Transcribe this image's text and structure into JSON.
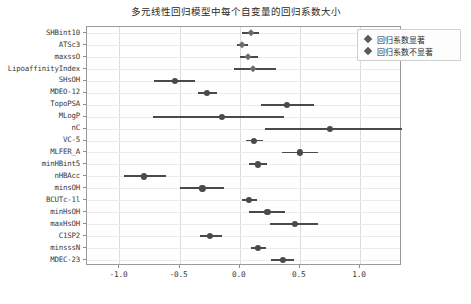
{
  "chart_data": {
    "type": "scatter",
    "title": "多元线性回归模型中每个自变量的回归系数大小",
    "xlabel": "",
    "ylabel": "",
    "xlim": [
      -1.27,
      1.35
    ],
    "ylim": [
      0,
      21
    ],
    "grid": true,
    "xticks": [
      -1.0,
      -0.5,
      0.0,
      0.5,
      1.0
    ],
    "xticklabels": [
      "-1.0",
      "-0.5",
      "0.0",
      "0.5",
      "1.0"
    ],
    "legend_position": "upper right",
    "legend": [
      {
        "label": "回归系数显著",
        "marker": "diamond",
        "color": "#5a5a5a"
      },
      {
        "label": "回归系数不显著",
        "marker": "diamond",
        "color": "#6b6b6b"
      }
    ],
    "categories": [
      "SHBint10",
      "ATSc3",
      "maxssO",
      "LipoaffinityIndex",
      "SHsOH",
      "MDEO-12",
      "TopoPSA",
      "MLogP",
      "nC",
      "VC-5",
      "MLFER_A",
      "minHBint5",
      "nHBAcc",
      "minsOH",
      "BCUTc-1l",
      "minHsOH",
      "maxHsOH",
      "C1SP2",
      "minsssN",
      "MDEC-23"
    ],
    "points": [
      {
        "label": "SHBint10",
        "coef": 0.09,
        "ci_low": 0.02,
        "ci_high": 0.16,
        "significant": false
      },
      {
        "label": "ATSc3",
        "coef": 0.02,
        "ci_low": -0.02,
        "ci_high": 0.07,
        "significant": false
      },
      {
        "label": "maxssO",
        "coef": 0.07,
        "ci_low": 0.0,
        "ci_high": 0.15,
        "significant": false
      },
      {
        "label": "LipoaffinityIndex",
        "coef": 0.11,
        "ci_low": -0.05,
        "ci_high": 0.3,
        "significant": false
      },
      {
        "label": "SHsOH",
        "coef": -0.54,
        "ci_low": -0.71,
        "ci_high": -0.37,
        "significant": true
      },
      {
        "label": "MDEO-12",
        "coef": -0.27,
        "ci_low": -0.35,
        "ci_high": -0.19,
        "significant": true
      },
      {
        "label": "TopoPSA",
        "coef": 0.39,
        "ci_low": 0.18,
        "ci_high": 0.62,
        "significant": true
      },
      {
        "label": "MLogP",
        "coef": -0.15,
        "ci_low": -0.72,
        "ci_high": 0.37,
        "significant": true
      },
      {
        "label": "nC",
        "coef": 0.75,
        "ci_low": 0.21,
        "ci_high": 1.35,
        "significant": true
      },
      {
        "label": "VC-5",
        "coef": 0.12,
        "ci_low": 0.05,
        "ci_high": 0.19,
        "significant": true
      },
      {
        "label": "MLFER_A",
        "coef": 0.5,
        "ci_low": 0.35,
        "ci_high": 0.65,
        "significant": true
      },
      {
        "label": "minHBint5",
        "coef": 0.15,
        "ci_low": 0.08,
        "ci_high": 0.23,
        "significant": true
      },
      {
        "label": "nHBAcc",
        "coef": -0.8,
        "ci_low": -0.96,
        "ci_high": -0.61,
        "significant": true
      },
      {
        "label": "minsOH",
        "coef": -0.31,
        "ci_low": -0.5,
        "ci_high": -0.13,
        "significant": true
      },
      {
        "label": "BCUTc-1l",
        "coef": 0.08,
        "ci_low": 0.02,
        "ci_high": 0.14,
        "significant": true
      },
      {
        "label": "minHsOH",
        "coef": 0.23,
        "ci_low": 0.08,
        "ci_high": 0.38,
        "significant": true
      },
      {
        "label": "maxHsOH",
        "coef": 0.46,
        "ci_low": 0.25,
        "ci_high": 0.65,
        "significant": true
      },
      {
        "label": "C1SP2",
        "coef": -0.25,
        "ci_low": -0.33,
        "ci_high": -0.15,
        "significant": true
      },
      {
        "label": "minsssN",
        "coef": 0.15,
        "ci_low": 0.09,
        "ci_high": 0.22,
        "significant": true
      },
      {
        "label": "MDEC-23",
        "coef": 0.36,
        "ci_low": 0.26,
        "ci_high": 0.45,
        "significant": true
      }
    ]
  },
  "colors": {
    "marker": "#4a4a4a",
    "marker_nonsig": "#6b6b6b",
    "errorbar": "#4a4a4a",
    "grid": "#dcdcdc",
    "axis": "#9a9a9a",
    "text": "#3a3a3a"
  }
}
